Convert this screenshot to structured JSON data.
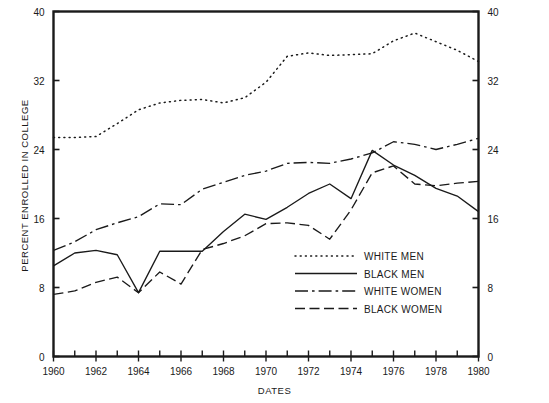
{
  "chart_data": {
    "type": "line",
    "title": "",
    "xlabel": "DATES",
    "ylabel": "PERCENT ENROLLED IN COLLEGE",
    "xlim": [
      1960,
      1980
    ],
    "ylim": [
      0,
      40
    ],
    "yticks": [
      0,
      8,
      16,
      24,
      32,
      40
    ],
    "yticklabels": [
      "0",
      "8",
      "16",
      "24",
      "32",
      "40"
    ],
    "xticks": [
      1960,
      1962,
      1964,
      1966,
      1968,
      1970,
      1972,
      1974,
      1976,
      1978,
      1980
    ],
    "xticklabels": [
      "1960",
      "1962",
      "1964",
      "1966",
      "1968",
      "1970",
      "1972",
      "1974",
      "1976",
      "1978",
      "1980"
    ],
    "minor_xticks_every": 1,
    "grid": false,
    "dual_y_axis": true,
    "legend_position": "center-right-inside",
    "x": [
      1960,
      1961,
      1962,
      1963,
      1964,
      1965,
      1966,
      1967,
      1968,
      1969,
      1970,
      1971,
      1972,
      1973,
      1974,
      1975,
      1976,
      1977,
      1978,
      1979,
      1980
    ],
    "series": [
      {
        "name": "WHITE MEN",
        "style": "dotted",
        "color": "#1a1a1a",
        "values": [
          25.4,
          25.4,
          25.5,
          27.0,
          28.6,
          29.4,
          29.7,
          29.8,
          29.4,
          30.0,
          31.8,
          34.8,
          35.2,
          34.9,
          35.0,
          35.1,
          36.6,
          37.5,
          36.5,
          35.5,
          34.2
        ]
      },
      {
        "name": "BLACK MEN",
        "style": "solid",
        "color": "#1a1a1a",
        "values": [
          10.5,
          12.0,
          12.3,
          11.8,
          7.4,
          12.2,
          12.2,
          12.2,
          14.5,
          16.5,
          15.9,
          17.3,
          18.9,
          20.0,
          18.3,
          23.9,
          22.2,
          21.0,
          19.5,
          18.6,
          16.8
        ]
      },
      {
        "name": "WHITE WOMEN",
        "style": "dashdot",
        "color": "#1a1a1a",
        "values": [
          12.3,
          13.3,
          14.7,
          15.5,
          16.2,
          17.7,
          17.6,
          19.4,
          20.2,
          21.0,
          21.5,
          22.4,
          22.5,
          22.4,
          22.9,
          23.6,
          24.9,
          24.6,
          24.0,
          24.6,
          25.3
        ]
      },
      {
        "name": "BLACK WOMEN",
        "style": "dashed",
        "color": "#1a1a1a",
        "values": [
          7.2,
          7.6,
          8.6,
          9.2,
          7.4,
          9.8,
          8.4,
          12.4,
          13.1,
          14.0,
          15.4,
          15.5,
          15.2,
          13.6,
          17.0,
          21.3,
          22.1,
          20.0,
          19.8,
          20.1,
          20.3
        ]
      }
    ],
    "annotations": [
      {
        "note": "WHITE MEN peaks near 1969 around 37.5 and declines to about 34 by 1980"
      },
      {
        "note": "All four series converge near 1964 at about 7.4 for BLACK MEN and BLACK WOMEN"
      }
    ]
  },
  "legend": {
    "entries": [
      {
        "label": "WHITE MEN",
        "style": "dotted"
      },
      {
        "label": "BLACK MEN",
        "style": "solid"
      },
      {
        "label": "WHITE WOMEN",
        "style": "dashdot"
      },
      {
        "label": "BLACK WOMEN",
        "style": "dashed"
      }
    ]
  }
}
